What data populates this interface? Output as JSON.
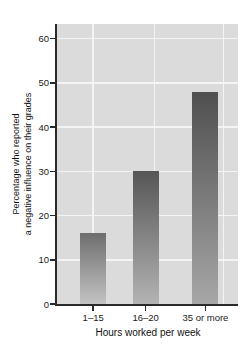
{
  "chart_data": {
    "type": "bar",
    "categories": [
      "1–15",
      "16–20",
      "35 or more"
    ],
    "values": [
      16,
      30,
      48
    ],
    "title": "",
    "xlabel": "Hours worked per week",
    "ylabel_lines": [
      "Percentage who reported",
      "a negative influence on their grades"
    ],
    "yticks": [
      0,
      10,
      20,
      30,
      40,
      50,
      60
    ],
    "ylim": [
      0,
      63
    ],
    "grid": true,
    "legend": false,
    "colors": {
      "plot_bg": "#dbdbdb",
      "gridline": "#f4f4f4",
      "axis": "#2a2a2a",
      "text": "#1a1a1a",
      "bar_top": [
        "#6e6e6e",
        "#565656",
        "#4f4f4f"
      ],
      "bar_bottom": [
        "#c3c3c3",
        "#b3b3b3",
        "#a7a7a7"
      ]
    },
    "bar_centers_frac": [
      0.2,
      0.49,
      0.82
    ],
    "vgrid_frac": [
      0.2,
      0.54,
      0.92
    ]
  }
}
